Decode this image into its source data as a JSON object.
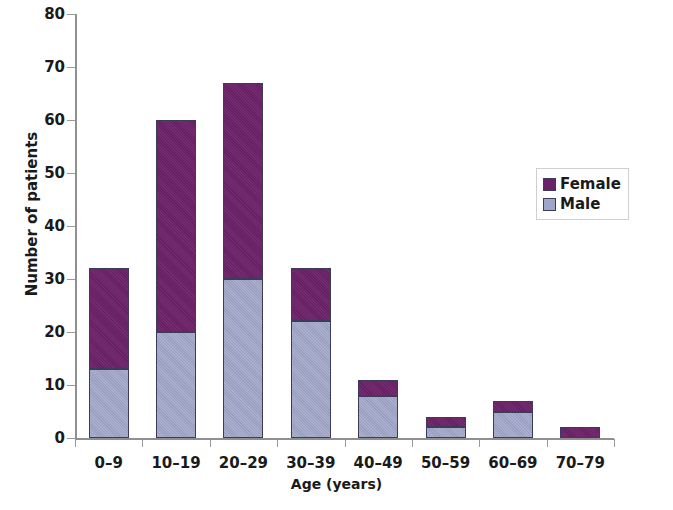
{
  "chart_data": {
    "type": "bar",
    "subtype": "stacked-vertical",
    "title": "",
    "xlabel": "Age (years)",
    "ylabel": "Number of patients",
    "categories": [
      "0–9",
      "10–19",
      "20–29",
      "30–39",
      "40–49",
      "50–59",
      "60–69",
      "70–79"
    ],
    "series": [
      {
        "name": "Male",
        "color": "#a0a6c8",
        "values": [
          13,
          20,
          30,
          22,
          8,
          2,
          5,
          0
        ]
      },
      {
        "name": "Female",
        "color": "#6b2168",
        "values": [
          19,
          40,
          37,
          10,
          3,
          2,
          2,
          2
        ]
      }
    ],
    "totals": [
      32,
      60,
      67,
      32,
      11,
      4,
      7,
      2
    ],
    "ylim": [
      0,
      80
    ],
    "yticks": [
      0,
      10,
      20,
      30,
      40,
      50,
      60,
      70,
      80
    ],
    "ytick_labels": [
      "0",
      "10",
      "20",
      "30",
      "40",
      "50",
      "60",
      "70",
      "80"
    ],
    "grid": false,
    "legend_position": "right-middle",
    "stack_order": [
      "Male",
      "Female"
    ]
  },
  "axes": {
    "y_title": "Number of patients",
    "x_title": "Age (years)"
  },
  "legend": {
    "entries": [
      {
        "label": "Female",
        "color": "#6b2168"
      },
      {
        "label": "Male",
        "color": "#a0a6c8"
      }
    ]
  },
  "colors": {
    "female": "#6b2168",
    "male": "#a0a6c8",
    "bar_border": "#3c3c5a",
    "axis": "#8f8f8f",
    "text": "#1a1a1a",
    "legend_border": "#cfcfcf",
    "background": "#ffffff"
  }
}
